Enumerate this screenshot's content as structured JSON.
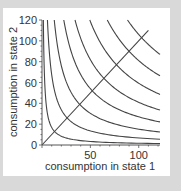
{
  "chart_data": {
    "type": "line",
    "title": "",
    "xlabel": "consumption in state 1",
    "ylabel": "consumption in state 2",
    "xlim": [
      0,
      122
    ],
    "ylim": [
      0,
      120
    ],
    "x_ticks": [
      50,
      100
    ],
    "y_ticks": [
      0,
      20,
      40,
      60,
      80,
      100,
      120
    ],
    "x_tick_labels": [
      "50",
      "100"
    ],
    "y_tick_labels": [
      "0",
      "20",
      "40",
      "60",
      "80",
      "100",
      "120"
    ],
    "grid": false,
    "legend": null,
    "series": [
      {
        "name": "indifference curve 1",
        "form": "x*y=k",
        "k": 169
      },
      {
        "name": "indifference curve 2",
        "form": "x*y=k",
        "k": 676
      },
      {
        "name": "indifference curve 3",
        "form": "x*y=k",
        "k": 1521
      },
      {
        "name": "indifference curve 4",
        "form": "x*y=k",
        "k": 2704
      },
      {
        "name": "indifference curve 5",
        "form": "x*y=k",
        "k": 4096
      },
      {
        "name": "indifference curve 6",
        "form": "x*y=k",
        "k": 5929
      },
      {
        "name": "indifference curve 7",
        "form": "x*y=k",
        "k": 8100
      },
      {
        "name": "indifference curve 8",
        "form": "x*y=k",
        "k": 10609
      },
      {
        "name": "certainty line",
        "form": "y=x",
        "x": [
          0,
          110
        ],
        "y": [
          0,
          110
        ]
      }
    ],
    "colors": {
      "line": "#444444",
      "axis": "#555555",
      "panel": "#ffffff",
      "background": "#d9d9d9"
    }
  }
}
